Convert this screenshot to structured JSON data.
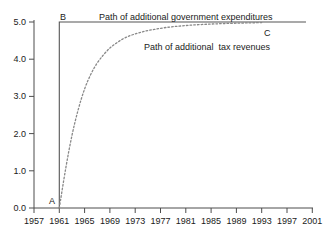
{
  "chart_data": {
    "type": "line",
    "title": "",
    "subtitle": "",
    "xlabel": "",
    "ylabel": "",
    "grid": false,
    "legend_position": "inline-annotations",
    "xlim": [
      1957,
      2001
    ],
    "ylim": [
      0.0,
      5.0
    ],
    "xticks": [
      "1957",
      "1961",
      "1965",
      "1969",
      "1973",
      "1977",
      "1981",
      "1985",
      "1989",
      "1993",
      "1997",
      "2001"
    ],
    "xtick_values": [
      1957,
      1961,
      1965,
      1969,
      1973,
      1977,
      1981,
      1985,
      1989,
      1993,
      1997,
      2001
    ],
    "yticks": [
      "0.0",
      "1.0",
      "2.0",
      "3.0",
      "4.0",
      "5.0"
    ],
    "ytick_values": [
      0.0,
      1.0,
      2.0,
      3.0,
      4.0,
      5.0
    ],
    "series": [
      {
        "name": "Path of additional government expenditures",
        "style": "solid",
        "color": "#555555",
        "x": [
          1961,
          1961,
          2000
        ],
        "values": [
          0.0,
          5.0,
          5.0
        ]
      },
      {
        "name": "Path of additional  tax revenues",
        "style": "dotted",
        "color": "#888888",
        "x": [
          1961,
          1962,
          1963,
          1964,
          1965,
          1966,
          1967,
          1968,
          1969,
          1970,
          1971,
          1972,
          1973,
          1974,
          1975,
          1976,
          1977,
          1978,
          1979,
          1980,
          1981,
          1982,
          1983,
          1984,
          1985,
          1986,
          1987,
          1988,
          1989,
          1990,
          1991,
          1992,
          1993
        ],
        "values": [
          0.0,
          1.05,
          1.95,
          2.65,
          3.2,
          3.6,
          3.9,
          4.12,
          4.3,
          4.43,
          4.54,
          4.62,
          4.68,
          4.73,
          4.77,
          4.8,
          4.83,
          4.855,
          4.875,
          4.89,
          4.905,
          4.918,
          4.928,
          4.937,
          4.945,
          4.952,
          4.958,
          4.963,
          4.968,
          4.972,
          4.976,
          4.98,
          4.984
        ]
      }
    ],
    "annotations": [
      {
        "id": "label-A",
        "text": "A",
        "x": 1961,
        "y": 0.1,
        "note": "start of both paths at baseline"
      },
      {
        "id": "label-B",
        "text": "B",
        "x": 1961,
        "y": 5.3,
        "note": "top of expenditure step"
      },
      {
        "id": "label-C",
        "text": "C",
        "x": 1992,
        "y": 4.75,
        "note": "tax revenues converge on expenditures"
      },
      {
        "id": "label-expenditures",
        "text": "Path of additional government expenditures",
        "x": 1971,
        "y": 5.25
      },
      {
        "id": "label-revenues",
        "text": "Path of additional  tax revenues",
        "x": 1978,
        "y": 4.35
      }
    ]
  },
  "axis": {
    "x_tick_labels": [
      "1957",
      "1961",
      "1965",
      "1969",
      "1973",
      "1977",
      "1981",
      "1985",
      "1989",
      "1993",
      "1997",
      "2001"
    ],
    "y_tick_labels": [
      "5.0",
      "4.0",
      "3.0",
      "2.0",
      "1.0",
      "0.0"
    ]
  },
  "labels": {
    "expenditures": "Path of additional government expenditures",
    "revenues": "Path of additional  tax revenues",
    "point_a": "A",
    "point_b": "B",
    "point_c": "C"
  },
  "colors": {
    "axis": "#4d4d4d",
    "expenditure_line": "#555555",
    "revenue_line": "#8a8a8a",
    "text": "#1a1a1a",
    "background": "#ffffff"
  }
}
